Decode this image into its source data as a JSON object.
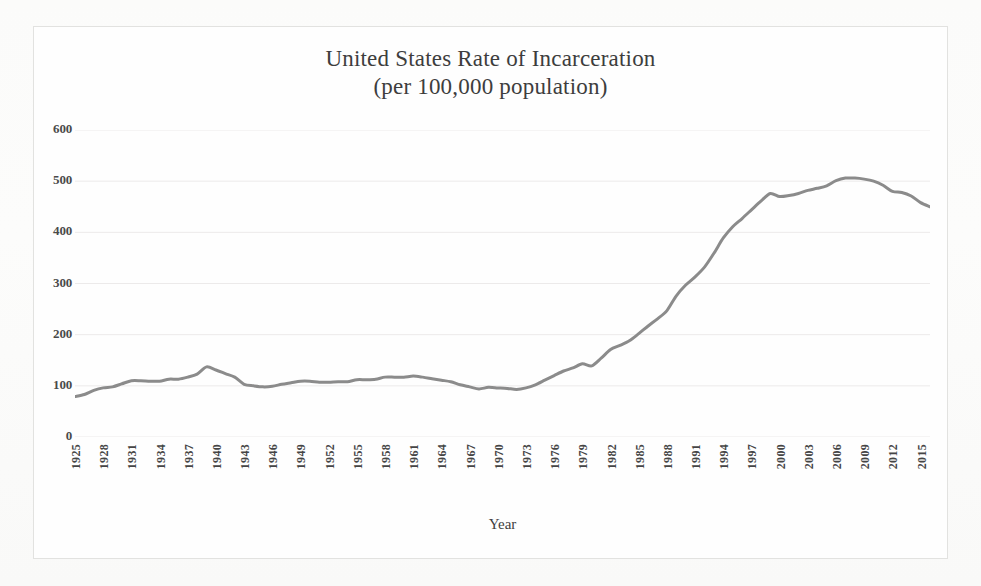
{
  "figure": {
    "title_line1": "United States Rate of Incarceration",
    "title_line2": "(per 100,000 population)",
    "background_color": "#fdfdfd",
    "frame_color": "#e2e2e0",
    "line_color": "#8b8b8b",
    "gridline_color": "#eceaea",
    "text_color": "#3d3d3d"
  },
  "axes": {
    "x_title": "Year",
    "y_title": "",
    "y_ticks": [
      600,
      500,
      400,
      300,
      200,
      100,
      0
    ],
    "y_tick_labels": [
      "600",
      "500",
      "400",
      "300",
      "200",
      "100",
      "0"
    ],
    "x_tick_labels": [
      "1925",
      "1928",
      "1931",
      "1934",
      "1937",
      "1940",
      "1943",
      "1946",
      "1949",
      "1952",
      "1955",
      "1958",
      "1961",
      "1964",
      "1967",
      "1970",
      "1973",
      "1976",
      "1979",
      "1982",
      "1985",
      "1988",
      "1991",
      "1994",
      "1997",
      "2000",
      "2003",
      "2006",
      "2009",
      "2012",
      "2015"
    ]
  },
  "chart_data": {
    "type": "line",
    "title": "United States Rate of Incarceration (per 100,000 population)",
    "subtitle": "(per 100,000 population)",
    "xlabel": "Year",
    "ylabel": "",
    "xlim": [
      1925,
      2016
    ],
    "ylim": [
      0,
      600
    ],
    "y_ticks": [
      0,
      100,
      200,
      300,
      400,
      500,
      600
    ],
    "x_tick_step": 3,
    "grid": "horizontal",
    "legend": "none",
    "series": [
      {
        "name": "Rate of incarceration per 100,000 population",
        "color": "#8b8b8b",
        "x": [
          1925,
          1926,
          1927,
          1928,
          1929,
          1930,
          1931,
          1932,
          1933,
          1934,
          1935,
          1936,
          1937,
          1938,
          1939,
          1940,
          1941,
          1942,
          1943,
          1944,
          1945,
          1946,
          1947,
          1948,
          1949,
          1950,
          1951,
          1952,
          1953,
          1954,
          1955,
          1956,
          1957,
          1958,
          1959,
          1960,
          1961,
          1962,
          1963,
          1964,
          1965,
          1966,
          1967,
          1968,
          1969,
          1970,
          1971,
          1972,
          1973,
          1974,
          1975,
          1976,
          1977,
          1978,
          1979,
          1980,
          1981,
          1982,
          1983,
          1984,
          1985,
          1986,
          1987,
          1988,
          1989,
          1990,
          1991,
          1992,
          1993,
          1994,
          1995,
          1996,
          1997,
          1998,
          1999,
          2000,
          2001,
          2002,
          2003,
          2004,
          2005,
          2006,
          2007,
          2008,
          2009,
          2010,
          2011,
          2012,
          2013,
          2014,
          2015,
          2016
        ],
        "values": [
          79,
          83,
          91,
          96,
          98,
          104,
          110,
          110,
          109,
          109,
          113,
          113,
          117,
          123,
          137,
          131,
          124,
          117,
          103,
          100,
          98,
          99,
          103,
          106,
          109,
          109,
          107,
          107,
          108,
          108,
          112,
          112,
          113,
          117,
          117,
          117,
          119,
          117,
          114,
          111,
          108,
          102,
          98,
          94,
          97,
          96,
          95,
          93,
          96,
          102,
          111,
          120,
          129,
          135,
          143,
          139,
          154,
          171,
          179,
          188,
          202,
          217,
          231,
          247,
          276,
          297,
          313,
          332,
          359,
          389,
          411,
          427,
          444,
          461,
          476,
          470,
          472,
          476,
          482,
          486,
          491,
          501,
          506,
          506,
          504,
          500,
          492,
          480,
          478,
          471,
          458,
          450
        ]
      }
    ]
  }
}
